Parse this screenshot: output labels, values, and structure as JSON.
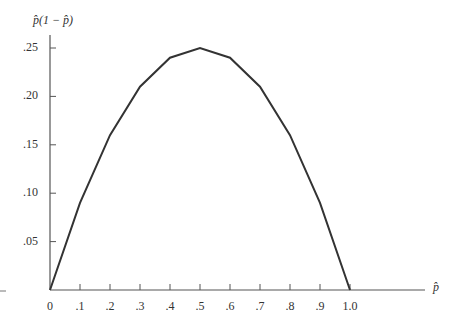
{
  "chart_data": {
    "type": "line",
    "title": "",
    "xlabel": "p̂",
    "ylabel": "p̂(1 − p̂)",
    "x": [
      0,
      0.1,
      0.2,
      0.3,
      0.4,
      0.5,
      0.6,
      0.7,
      0.8,
      0.9,
      1.0
    ],
    "series": [
      {
        "name": "p̂(1 − p̂)",
        "values": [
          0,
          0.09,
          0.16,
          0.21,
          0.24,
          0.25,
          0.24,
          0.21,
          0.16,
          0.09,
          0
        ]
      }
    ],
    "xlim": [
      0,
      1.0
    ],
    "ylim": [
      0,
      0.25
    ],
    "x_tick_labels": [
      "0",
      ".1",
      ".2",
      ".3",
      ".4",
      ".5",
      ".6",
      ".7",
      ".8",
      ".9",
      "1.0"
    ],
    "y_tick_labels": [
      ".05",
      ".10",
      ".15",
      ".20",
      ".25"
    ],
    "grid": false,
    "legend": "none"
  }
}
